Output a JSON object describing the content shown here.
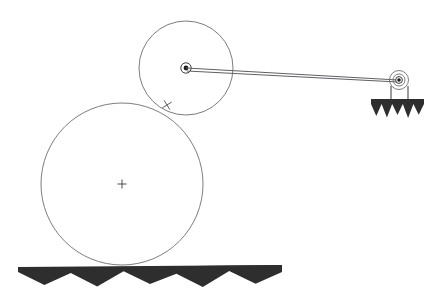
{
  "diagram": {
    "background_color": "#ffffff",
    "line_color": "#6e6e72",
    "hatch_color": "#2e2e2e",
    "pivot_color": "#1d1d20",
    "canvas": {
      "width": 440,
      "height": 306
    },
    "bodies": {
      "large_wheel": {
        "name": "large-wheel",
        "center_x": 122,
        "center_y": 184,
        "radius": 81,
        "center_marker": "plus-cross",
        "marker_size": 9
      },
      "small_wheel": {
        "name": "small-wheel",
        "center_x": 186,
        "center_y": 68,
        "radius": 47,
        "center_marker": "pivot-dot",
        "pivot_outer_radius": 5.2,
        "pivot_dot_radius": 2.4
      },
      "contact_tick": {
        "name": "contact-tick-mark",
        "x": 167,
        "y": 105,
        "length": 11,
        "angle_deg": 58
      }
    },
    "link_rod": {
      "name": "connecting-rod",
      "from_x": 186,
      "from_y": 68,
      "to_x": 398,
      "to_y": 80,
      "stroke_width": 1.0
    },
    "fixed_pivot": {
      "name": "fixed-pivot-support",
      "center_x": 399,
      "center_y": 80,
      "outer_radius": 9.5,
      "mid_radius": 6.0,
      "inner_radius": 3.4,
      "dot_radius": 1.8,
      "leg_left_x": 391,
      "leg_right_x": 408,
      "leg_top_y": 88,
      "leg_bottom_y": 101
    },
    "supports": {
      "bracket_ground": {
        "name": "bracket-ground-hatch",
        "top_y": 99,
        "left_x": 371,
        "right_x": 424,
        "teeth": 5,
        "tooth_depth": 17
      },
      "floor_ground": {
        "name": "floor-ground-hatch",
        "top_y": 267,
        "left_x": 18,
        "right_x": 282,
        "teeth": 5,
        "tooth_depth": 18
      }
    }
  }
}
